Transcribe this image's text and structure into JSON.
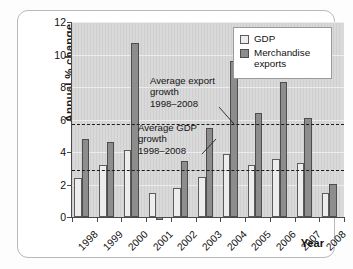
{
  "chart_data": {
    "type": "bar",
    "title": "",
    "xlabel": "Year",
    "ylabel": "Annual % change",
    "categories": [
      "1998",
      "1999",
      "2000",
      "2001",
      "2002",
      "2003",
      "2004",
      "2005",
      "2006",
      "2007",
      "2008"
    ],
    "series": [
      {
        "name": "GDP",
        "values": [
          2.4,
          3.2,
          4.1,
          1.5,
          1.8,
          2.45,
          3.9,
          3.2,
          3.6,
          3.35,
          1.5
        ]
      },
      {
        "name": "Merchandise exports",
        "values": [
          4.8,
          4.6,
          10.7,
          -0.2,
          3.45,
          5.5,
          9.6,
          6.4,
          8.3,
          6.1,
          2.05
        ]
      }
    ],
    "ylim": [
      0,
      12
    ],
    "yticks": [
      0,
      2,
      4,
      6,
      8,
      10,
      12
    ],
    "ytick_labels": [
      "0",
      "2",
      "4",
      "6",
      "8",
      "10",
      "12"
    ],
    "grid": true,
    "legend_position": "top-right",
    "reference_lines": [
      {
        "name": "Average export growth 1998–2008",
        "value": 5.7,
        "style": "dashed"
      },
      {
        "name": "Average GDP growth 1998–2008",
        "value": 2.9,
        "style": "dashed"
      }
    ],
    "annotations": [
      {
        "text": "Average export\ngrowth\n1998–2008",
        "target_value": 5.7
      },
      {
        "text": "Average GDP\ngrowth\n1998–2008",
        "target_value": 2.9
      }
    ],
    "colors": {
      "gdp": "#ededed",
      "exports": "#8d8d8d",
      "plot_background": "#d9d9d9",
      "axis": "#4a4a4a",
      "reference_line": "#1b1b1b"
    }
  },
  "axes": {
    "y_title": "Annual % change",
    "x_title": "Year"
  },
  "legend": {
    "items": [
      {
        "label": "GDP",
        "swatch": "gdp"
      },
      {
        "label": "Merchandise exports",
        "swatch": "exp"
      }
    ]
  },
  "annotations": {
    "export": "Average export\ngrowth\n1998–2008",
    "gdp": "Average GDP\ngrowth\n1998–2008"
  }
}
